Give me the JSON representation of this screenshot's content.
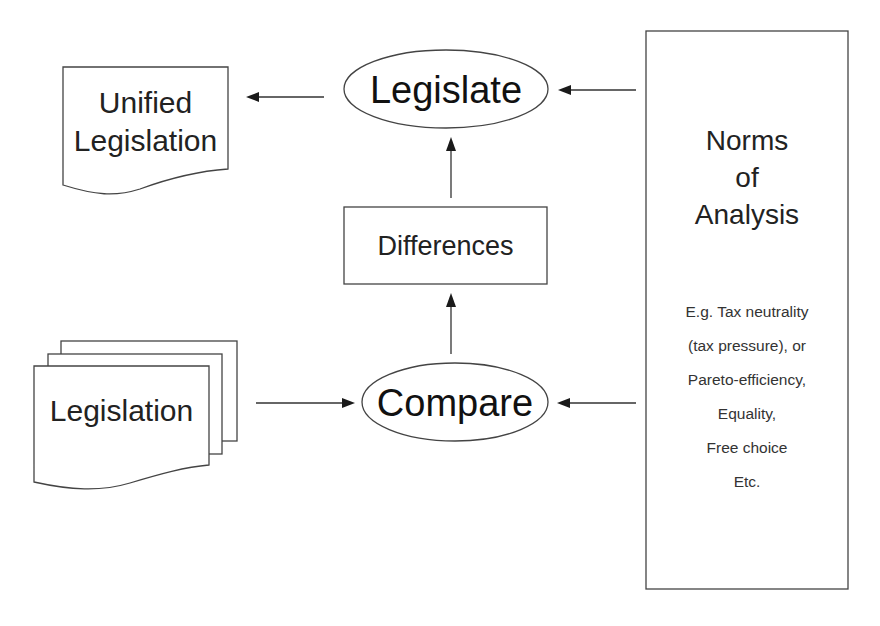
{
  "diagram": {
    "nodes": {
      "unified_legislation": {
        "line1": "Unified",
        "line2": "Legislation",
        "shape": "document"
      },
      "legislate": {
        "label": "Legislate",
        "shape": "ellipse"
      },
      "differences": {
        "label": "Differences",
        "shape": "rectangle"
      },
      "legislation": {
        "label": "Legislation",
        "shape": "multi-document"
      },
      "compare": {
        "label": "Compare",
        "shape": "ellipse"
      },
      "norms": {
        "title_lines": [
          "Norms",
          "of",
          "Analysis"
        ],
        "items": [
          "E.g. Tax neutrality",
          "(tax pressure), or",
          "Pareto-efficiency,",
          "Equality,",
          "Free choice",
          "Etc."
        ],
        "shape": "rectangle"
      }
    },
    "edges": [
      {
        "from": "legislate",
        "to": "unified_legislation"
      },
      {
        "from": "norms",
        "to": "legislate"
      },
      {
        "from": "differences",
        "to": "legislate"
      },
      {
        "from": "compare",
        "to": "differences"
      },
      {
        "from": "legislation",
        "to": "compare"
      },
      {
        "from": "norms",
        "to": "compare"
      }
    ]
  }
}
